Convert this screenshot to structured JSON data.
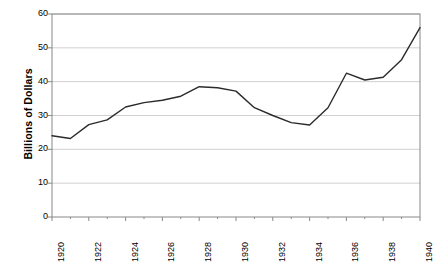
{
  "chart_data": {
    "type": "line",
    "title": "",
    "subtitle": "",
    "xlabel": "",
    "ylabel": "Billions of Dollars",
    "xlim": [
      1920,
      1940
    ],
    "ylim": [
      0,
      60
    ],
    "ytick_labels": [
      "0",
      "10",
      "20",
      "30",
      "40",
      "50",
      "60"
    ],
    "yticks": [
      0,
      10,
      20,
      30,
      40,
      50,
      60
    ],
    "xtick_labels": [
      "1920",
      "1922",
      "1924",
      "1926",
      "1928",
      "1930",
      "1932",
      "1934",
      "1936",
      "1938",
      "1940"
    ],
    "xticks": [
      1920,
      1922,
      1924,
      1926,
      1928,
      1930,
      1932,
      1934,
      1936,
      1938,
      1940
    ],
    "minor_xticks": [
      1921,
      1923,
      1925,
      1927,
      1929,
      1931,
      1933,
      1935,
      1937,
      1939
    ],
    "grid": "horizontal",
    "legend": "none",
    "line_color": "#2b2b2b",
    "grid_color": "#d0d0d0",
    "axis_color": "#888888",
    "x": [
      1920,
      1921,
      1922,
      1923,
      1924,
      1925,
      1926,
      1927,
      1928,
      1929,
      1930,
      1931,
      1932,
      1933,
      1934,
      1935,
      1936,
      1937,
      1938,
      1939,
      1940
    ],
    "values": [
      24.0,
      23.2,
      27.3,
      28.7,
      32.5,
      33.8,
      34.5,
      35.7,
      38.5,
      38.2,
      37.2,
      32.3,
      30.0,
      27.9,
      27.2,
      32.3,
      42.5,
      40.5,
      41.3,
      46.5,
      56.0
    ],
    "series": [
      {
        "name": "Billions of Dollars",
        "values": [
          24.0,
          23.2,
          27.3,
          28.7,
          32.5,
          33.8,
          34.5,
          35.7,
          38.5,
          38.2,
          37.2,
          32.3,
          30.0,
          27.9,
          27.2,
          32.3,
          42.5,
          40.5,
          41.3,
          46.5,
          56.0
        ]
      }
    ]
  }
}
